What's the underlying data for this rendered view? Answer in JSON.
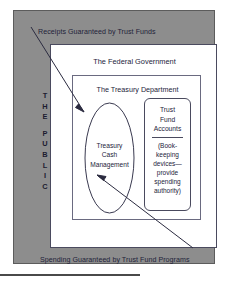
{
  "diagram": {
    "public_panel": {
      "label_letters": [
        "T",
        "H",
        "E",
        "P",
        "U",
        "B",
        "L",
        "I",
        "C"
      ],
      "label_line_1": "THE",
      "label_line_2": "PUBLIC",
      "fill_color": "#8d8d8d"
    },
    "caption_top": "Receipts Guaranteed by Trust Funds",
    "caption_bottom": "Spending Guaranteed by Trust Fund Programs",
    "federal_box": {
      "title": "The Federal Government",
      "fill_color": "#ffffff"
    },
    "treasury_box": {
      "title": "The Treasury Department",
      "fill_color": "#ffffff"
    },
    "ellipse": {
      "line_1": "Treasury",
      "line_2": "Cash",
      "line_3": "Management"
    },
    "trust_fund_box": {
      "title_line_1": "Trust",
      "title_line_2": "Fund",
      "title_line_3": "Accounts",
      "note_line_1": "(Book-",
      "note_line_2": "keeping",
      "note_line_3": "devices—",
      "note_line_4": "provide",
      "note_line_5": "spending",
      "note_line_6": "authority)"
    },
    "arrows": [
      {
        "name": "receipts-arrow",
        "from": [
          31,
          27
        ],
        "to": [
          84,
          112
        ],
        "direction": "down-right"
      },
      {
        "name": "spending-arrow",
        "from": [
          193,
          248
        ],
        "to": [
          97,
          175
        ],
        "direction": "up-left"
      }
    ]
  }
}
